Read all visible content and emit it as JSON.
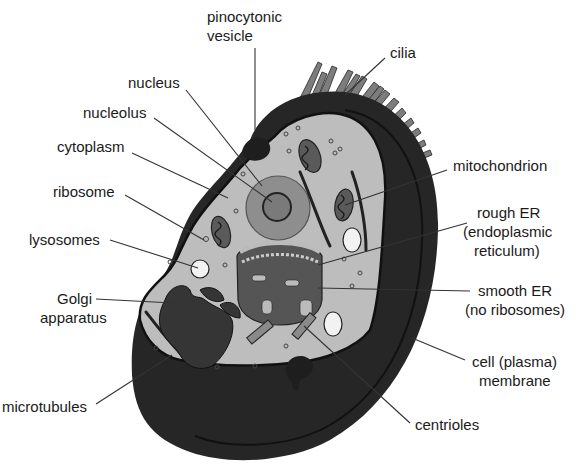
{
  "colors": {
    "background": "#ffffff",
    "cell_outer": "#262626",
    "cytoplasm": "#bdbdbd",
    "nucleus": "#8e8e8e",
    "organelle_dark": "#4a4a4a",
    "cilia": "#7a7a7a",
    "text": "#1a1a1a"
  },
  "labels": {
    "pinocytonic_vesicle": [
      "pinocytonic",
      "vesicle"
    ],
    "cilia": "cilia",
    "nucleus": "nucleus",
    "nucleolus": "nucleolus",
    "cytoplasm": "cytoplasm",
    "ribosome": "ribosome",
    "lysosomes": "lysosomes",
    "golgi_apparatus": [
      "Golgi",
      "apparatus"
    ],
    "microtubules": "microtubules",
    "mitochondrion": "mitochondrion",
    "rough_er": [
      "rough ER",
      "(endoplasmic",
      "reticulum)"
    ],
    "smooth_er": [
      "smooth ER",
      "(no ribosomes)"
    ],
    "cell_membrane": [
      "cell (plasma)",
      "membrane"
    ],
    "centrioles": "centrioles"
  }
}
